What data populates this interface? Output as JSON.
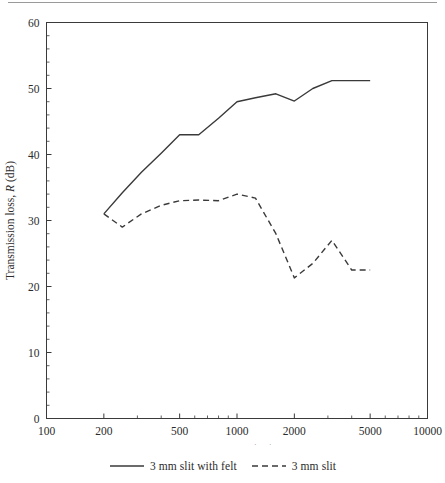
{
  "figure": {
    "name": "transmission-loss-figure",
    "background": "#ffffff",
    "ink_color": "#3a3a3a",
    "text_color": "#2b2b2b"
  },
  "chart_data": {
    "type": "line",
    "title": "",
    "xlabel": "Frequency (Hz)",
    "ylabel": "Transmission loss, R (dB)",
    "ylabel_parts": {
      "lead": "Transmission loss, ",
      "italic": "R",
      "trail": " (dB)"
    },
    "xscale": "log",
    "yscale": "linear",
    "xlim": [
      100,
      10000
    ],
    "ylim": [
      0,
      60
    ],
    "grid": false,
    "legend_position": "below-axes",
    "x_major_ticks": [
      100,
      200,
      500,
      1000,
      2000,
      5000,
      10000
    ],
    "x_tick_labels": [
      "100",
      "200",
      "500",
      "1000",
      "2000",
      "5000",
      "10000"
    ],
    "x_minor_ticks": [
      300,
      400,
      600,
      700,
      800,
      900,
      3000,
      4000,
      6000,
      7000,
      8000,
      9000
    ],
    "y_major_ticks": [
      0,
      10,
      20,
      30,
      40,
      50,
      60
    ],
    "y_tick_labels": [
      "0",
      "10",
      "20",
      "30",
      "40",
      "50",
      "60"
    ],
    "y_minor_step": 2,
    "series": [
      {
        "name": "3 mm slit with felt",
        "style": "solid",
        "color": "#3a3a3a",
        "x": [
          200,
          250,
          315,
          400,
          500,
          630,
          800,
          1000,
          1250,
          1600,
          2000,
          2500,
          3150,
          4000,
          5000
        ],
        "values": [
          31.0,
          34.2,
          37.3,
          40.2,
          43.0,
          43.0,
          45.5,
          48.0,
          48.6,
          49.2,
          48.1,
          50.0,
          51.2,
          51.2,
          51.2
        ]
      },
      {
        "name": "3 mm slit",
        "style": "dashed",
        "color": "#3a3a3a",
        "x": [
          200,
          250,
          315,
          400,
          500,
          630,
          800,
          1000,
          1250,
          1600,
          2000,
          2500,
          3150,
          4000,
          5000
        ],
        "values": [
          31.0,
          29.0,
          31.0,
          32.3,
          33.0,
          33.1,
          33.0,
          34.0,
          33.4,
          28.0,
          21.3,
          23.5,
          27.0,
          22.5,
          22.5
        ]
      }
    ]
  },
  "legend": {
    "entries": [
      {
        "label": "3 mm slit with felt",
        "style": "solid"
      },
      {
        "label": "3 mm slit",
        "style": "dashed"
      }
    ]
  }
}
